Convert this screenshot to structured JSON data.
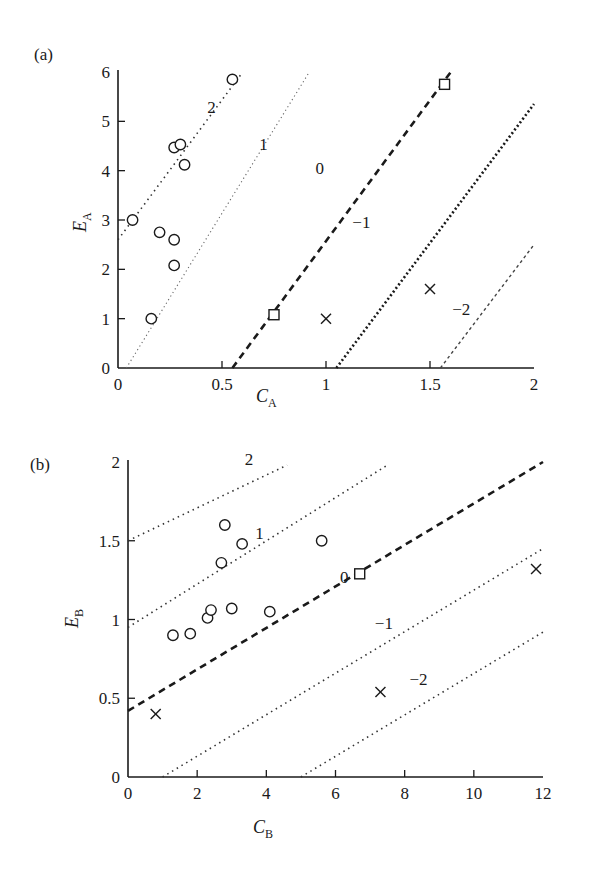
{
  "chart_data": [
    {
      "panel": "(a)",
      "type": "scatter",
      "xlabel": "C_A",
      "ylabel": "E_A",
      "xlim": [
        0,
        2
      ],
      "ylim": [
        0,
        6
      ],
      "xticks": [
        "0",
        "0.5",
        "1",
        "1.5",
        "2"
      ],
      "yticks": [
        "0",
        "1",
        "2",
        "3",
        "4",
        "5",
        "6"
      ],
      "grid": false,
      "series": [
        {
          "name": "circles",
          "marker": "circle",
          "points": [
            [
              0.07,
              3.0
            ],
            [
              0.27,
              4.47
            ],
            [
              0.3,
              4.53
            ],
            [
              0.32,
              4.12
            ],
            [
              0.2,
              2.75
            ],
            [
              0.27,
              2.6
            ],
            [
              0.27,
              2.08
            ],
            [
              0.16,
              1.0
            ],
            [
              0.55,
              5.85
            ]
          ]
        },
        {
          "name": "squares",
          "marker": "square",
          "points": [
            [
              0.75,
              1.08
            ],
            [
              1.57,
              5.75
            ]
          ]
        },
        {
          "name": "crosses",
          "marker": "cross",
          "points": [
            [
              1.0,
              1.0
            ],
            [
              1.5,
              1.6
            ]
          ]
        }
      ],
      "reference_lines": [
        {
          "label": "2",
          "style": "dotted",
          "from": [
            0.0,
            2.6
          ],
          "to": [
            0.6,
            6.0
          ],
          "label_pos": [
            0.45,
            5.3
          ]
        },
        {
          "label": "1",
          "style": "dotted-light",
          "from": [
            0.04,
            0.0
          ],
          "to": [
            0.92,
            6.0
          ],
          "label_pos": [
            0.7,
            4.55
          ]
        },
        {
          "label": "0",
          "style": "dashed",
          "from": [
            0.55,
            0.0
          ],
          "to": [
            1.6,
            6.0
          ],
          "label_pos": [
            0.97,
            4.05
          ]
        },
        {
          "label": "-1",
          "style": "dotted-heavy",
          "from": [
            1.05,
            0.0
          ],
          "to": [
            2.0,
            5.35
          ],
          "label_pos": [
            1.17,
            2.95
          ]
        },
        {
          "label": "-2",
          "style": "dotted-fine",
          "from": [
            1.55,
            0.0
          ],
          "to": [
            2.0,
            2.5
          ],
          "label_pos": [
            1.65,
            1.2
          ]
        }
      ]
    },
    {
      "panel": "(b)",
      "type": "scatter",
      "xlabel": "C_B",
      "ylabel": "E_B",
      "xlim": [
        0,
        12
      ],
      "ylim": [
        0,
        2
      ],
      "xticks": [
        "0",
        "2",
        "4",
        "6",
        "8",
        "10",
        "12"
      ],
      "yticks": [
        "0",
        "0.5",
        "1",
        "1.5",
        "2"
      ],
      "grid": false,
      "series": [
        {
          "name": "circles",
          "marker": "circle",
          "points": [
            [
              1.3,
              0.9
            ],
            [
              1.8,
              0.91
            ],
            [
              2.3,
              1.01
            ],
            [
              2.4,
              1.06
            ],
            [
              3.0,
              1.07
            ],
            [
              2.7,
              1.36
            ],
            [
              2.8,
              1.6
            ],
            [
              3.3,
              1.48
            ],
            [
              4.1,
              1.05
            ],
            [
              5.6,
              1.5
            ]
          ]
        },
        {
          "name": "squares",
          "marker": "square",
          "points": [
            [
              6.7,
              1.29
            ]
          ]
        },
        {
          "name": "crosses",
          "marker": "cross",
          "points": [
            [
              0.8,
              0.4
            ],
            [
              7.3,
              0.54
            ],
            [
              11.8,
              1.32
            ]
          ]
        }
      ],
      "reference_lines": [
        {
          "label": "2",
          "style": "dotted",
          "from": [
            0.0,
            1.5
          ],
          "to": [
            4.6,
            1.98
          ],
          "label_pos": [
            3.5,
            2.02
          ]
        },
        {
          "label": "1",
          "style": "dotted",
          "from": [
            0.0,
            0.95
          ],
          "to": [
            7.5,
            1.98
          ],
          "label_pos": [
            3.8,
            1.55
          ]
        },
        {
          "label": "0",
          "style": "dashed",
          "from": [
            0.0,
            0.42
          ],
          "to": [
            12.0,
            2.0
          ],
          "label_pos": [
            6.25,
            1.27
          ]
        },
        {
          "label": "-1",
          "style": "dotted",
          "from": [
            1.0,
            0.0
          ],
          "to": [
            12.0,
            1.45
          ],
          "label_pos": [
            7.4,
            0.98
          ]
        },
        {
          "label": "-2",
          "style": "dotted",
          "from": [
            5.0,
            0.0
          ],
          "to": [
            12.0,
            0.92
          ],
          "label_pos": [
            8.4,
            0.62
          ]
        }
      ]
    }
  ],
  "labels": {
    "panel_a": "(a)",
    "panel_b": "(b)",
    "xlabel_a_main": "C",
    "xlabel_a_sub": "A",
    "ylabel_a_main": "E",
    "ylabel_a_sub": "A",
    "xlabel_b_main": "C",
    "xlabel_b_sub": "B",
    "ylabel_b_main": "E",
    "ylabel_b_sub": "B"
  }
}
